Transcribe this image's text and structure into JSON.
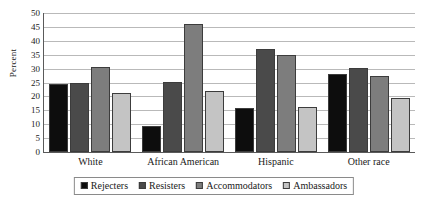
{
  "chart_data": {
    "type": "bar",
    "title": "",
    "xlabel": "",
    "ylabel": "Percent",
    "ylim": [
      0,
      50
    ],
    "yticks": [
      0,
      5,
      10,
      15,
      20,
      25,
      30,
      35,
      40,
      45,
      50
    ],
    "grid": true,
    "legend_position": "bottom",
    "categories": [
      "White",
      "African American",
      "Hispanic",
      "Other race"
    ],
    "series": [
      {
        "name": "Rejecters",
        "color": "#0d0d0d",
        "values": [
          24.4,
          9.3,
          15.8,
          28.0
        ]
      },
      {
        "name": "Resisters",
        "color": "#4a4a4a",
        "values": [
          24.8,
          25.2,
          37.0,
          30.1
        ]
      },
      {
        "name": "Accommodators",
        "color": "#7d7d7d",
        "values": [
          30.6,
          46.0,
          35.0,
          27.3
        ]
      },
      {
        "name": "Ambassadors",
        "color": "#c4c4c4",
        "values": [
          21.1,
          22.0,
          16.2,
          19.6
        ]
      }
    ]
  }
}
